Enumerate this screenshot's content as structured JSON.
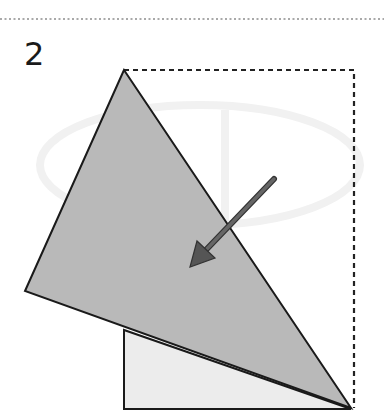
{
  "step_number": "2",
  "diagram": {
    "colors": {
      "triangle_fill": "#b9b9b9",
      "square_fill": "#ececec",
      "line": "#1a1a1a",
      "arrow": "#555555",
      "watermark": "#f1f1f1"
    },
    "arrow_icon": "fold-direction-arrow"
  }
}
